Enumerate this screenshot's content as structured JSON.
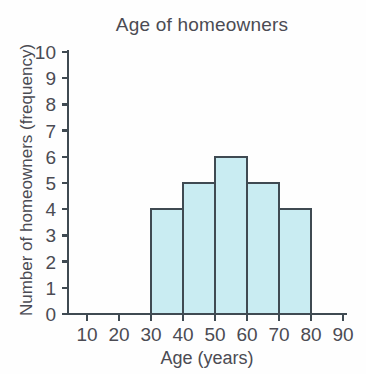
{
  "chart_data": {
    "type": "bar",
    "title": "Age of homeowners",
    "xlabel": "Age (years)",
    "ylabel": "Number of homeowners (frequency)",
    "categories": [
      "30-40",
      "40-50",
      "50-60",
      "60-70",
      "70-80"
    ],
    "bin_edges": [
      30,
      40,
      50,
      60,
      70,
      80
    ],
    "values": [
      4,
      5,
      6,
      5,
      4
    ],
    "x": [
      35,
      45,
      55,
      65,
      75
    ],
    "xlim": [
      0,
      90
    ],
    "ylim": [
      0,
      10
    ],
    "x_ticks": [
      10,
      20,
      30,
      40,
      50,
      60,
      70,
      80,
      90
    ],
    "x_tick_labels": [
      "10",
      "20",
      "30",
      "40",
      "50",
      "60",
      "70",
      "80",
      "90"
    ],
    "y_ticks": [
      0,
      1,
      2,
      3,
      4,
      5,
      6,
      7,
      8,
      9,
      10
    ],
    "y_tick_labels": [
      "0",
      "1",
      "2",
      "3",
      "4",
      "5",
      "6",
      "7",
      "8",
      "9",
      "10"
    ],
    "grid": false,
    "legend": false,
    "bar_fill_color": "#c9ecf2",
    "bar_edge_color": "#3f4a52",
    "axis_color": "#3f4a52",
    "text_color": "#4b4b53",
    "background_color": "#fefefe"
  }
}
